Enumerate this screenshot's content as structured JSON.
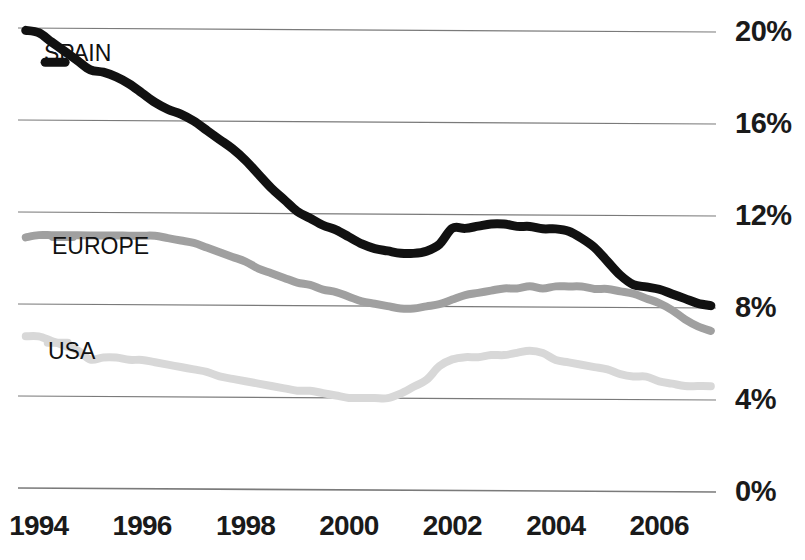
{
  "chart_data": {
    "type": "line",
    "title": "",
    "subtitle": "",
    "xlabel": "",
    "ylabel": "",
    "xlim": [
      1993.6,
      2007.1
    ],
    "ylim": [
      0,
      20
    ],
    "grid": true,
    "grid_axis": "y",
    "legend_position": "inline-left",
    "x_ticks": [
      1994,
      1996,
      1998,
      2000,
      2002,
      2004,
      2006
    ],
    "x_tick_labels": [
      "1994",
      "1996",
      "1998",
      "2000",
      "2002",
      "2004",
      "2006"
    ],
    "y_ticks": [
      0,
      4,
      8,
      12,
      16,
      20
    ],
    "y_tick_labels": [
      "0%",
      "4%",
      "8%",
      "12%",
      "16%",
      "20%"
    ],
    "series": [
      {
        "name": "SPAIN",
        "color": "#111111",
        "line_width": 9,
        "label_x": 1994.55,
        "label_y": 18.6,
        "x": [
          1993.75,
          1994.0,
          1994.25,
          1994.5,
          1994.75,
          1995.0,
          1995.25,
          1995.5,
          1995.75,
          1996.0,
          1996.25,
          1996.5,
          1996.75,
          1997.0,
          1997.25,
          1997.5,
          1997.75,
          1998.0,
          1998.25,
          1998.5,
          1998.75,
          1999.0,
          1999.25,
          1999.5,
          1999.75,
          2000.0,
          2000.25,
          2000.5,
          2000.75,
          2001.0,
          2001.25,
          2001.5,
          2001.75,
          2002.0,
          2002.25,
          2002.5,
          2002.75,
          2003.0,
          2003.25,
          2003.5,
          2003.75,
          2004.0,
          2004.25,
          2004.5,
          2004.75,
          2005.0,
          2005.25,
          2005.5,
          2005.75,
          2006.0,
          2006.25,
          2006.5,
          2006.75,
          2007.0
        ],
        "y": [
          19.9,
          19.8,
          19.4,
          19.0,
          18.6,
          18.2,
          18.1,
          17.9,
          17.6,
          17.2,
          16.8,
          16.5,
          16.3,
          16.0,
          15.6,
          15.2,
          14.8,
          14.3,
          13.7,
          13.1,
          12.6,
          12.1,
          11.8,
          11.5,
          11.3,
          11.0,
          10.7,
          10.5,
          10.4,
          10.3,
          10.3,
          10.4,
          10.7,
          11.4,
          11.4,
          11.5,
          11.6,
          11.6,
          11.5,
          11.5,
          11.4,
          11.4,
          11.3,
          11.0,
          10.6,
          10.0,
          9.4,
          9.0,
          8.9,
          8.8,
          8.6,
          8.4,
          8.2,
          8.1
        ]
      },
      {
        "name": "EUROPE",
        "color": "#a0a0a0",
        "line_width": 8,
        "label_x": 1994.7,
        "label_y": 11.0,
        "x": [
          1993.75,
          1994.0,
          1994.25,
          1994.5,
          1994.75,
          1995.0,
          1995.25,
          1995.5,
          1995.75,
          1996.0,
          1996.25,
          1996.5,
          1996.75,
          1997.0,
          1997.25,
          1997.5,
          1997.75,
          1998.0,
          1998.25,
          1998.5,
          1998.75,
          1999.0,
          1999.25,
          1999.5,
          1999.75,
          2000.0,
          2000.25,
          2000.5,
          2000.75,
          2001.0,
          2001.25,
          2001.5,
          2001.75,
          2002.0,
          2002.25,
          2002.5,
          2002.75,
          2003.0,
          2003.25,
          2003.5,
          2003.75,
          2004.0,
          2004.25,
          2004.5,
          2004.75,
          2005.0,
          2005.25,
          2005.5,
          2005.75,
          2006.0,
          2006.25,
          2006.5,
          2006.75,
          2007.0
        ],
        "y": [
          10.9,
          11.0,
          11.0,
          11.0,
          11.0,
          11.0,
          11.0,
          11.0,
          11.0,
          11.0,
          11.0,
          10.9,
          10.8,
          10.7,
          10.5,
          10.3,
          10.1,
          9.9,
          9.6,
          9.4,
          9.2,
          9.0,
          8.9,
          8.7,
          8.6,
          8.4,
          8.2,
          8.1,
          8.0,
          7.9,
          7.9,
          8.0,
          8.1,
          8.3,
          8.5,
          8.6,
          8.7,
          8.8,
          8.8,
          8.9,
          8.8,
          8.9,
          8.9,
          8.9,
          8.8,
          8.8,
          8.7,
          8.6,
          8.4,
          8.2,
          7.9,
          7.5,
          7.2,
          7.0
        ]
      },
      {
        "name": "USA",
        "color": "#d8d8d8",
        "line_width": 8,
        "label_x": 1994.6,
        "label_y": 6.4,
        "x": [
          1993.75,
          1994.0,
          1994.25,
          1994.5,
          1994.75,
          1995.0,
          1995.25,
          1995.5,
          1995.75,
          1996.0,
          1996.25,
          1996.5,
          1996.75,
          1997.0,
          1997.25,
          1997.5,
          1997.75,
          1998.0,
          1998.25,
          1998.5,
          1998.75,
          1999.0,
          1999.25,
          1999.5,
          1999.75,
          2000.0,
          2000.25,
          2000.5,
          2000.75,
          2001.0,
          2001.25,
          2001.5,
          2001.75,
          2002.0,
          2002.25,
          2002.5,
          2002.75,
          2003.0,
          2003.25,
          2003.5,
          2003.75,
          2004.0,
          2004.25,
          2004.5,
          2004.75,
          2005.0,
          2005.25,
          2005.5,
          2005.75,
          2006.0,
          2006.25,
          2006.5,
          2006.75,
          2007.0
        ],
        "y": [
          6.6,
          6.6,
          6.4,
          6.2,
          6.0,
          5.6,
          5.7,
          5.7,
          5.6,
          5.6,
          5.5,
          5.4,
          5.3,
          5.2,
          5.1,
          4.9,
          4.8,
          4.7,
          4.6,
          4.5,
          4.4,
          4.3,
          4.3,
          4.2,
          4.1,
          4.0,
          4.0,
          4.0,
          4.0,
          4.2,
          4.5,
          4.8,
          5.4,
          5.7,
          5.8,
          5.8,
          5.9,
          5.9,
          6.0,
          6.1,
          6.0,
          5.7,
          5.6,
          5.5,
          5.4,
          5.3,
          5.1,
          5.0,
          5.0,
          4.8,
          4.7,
          4.6,
          4.6,
          4.6
        ]
      }
    ]
  },
  "axis": {
    "y_labels": [
      "20%",
      "16%",
      "12%",
      "8%",
      "4%",
      "0%"
    ],
    "x_labels": [
      "1994",
      "1996",
      "1998",
      "2000",
      "2002",
      "2004",
      "2006"
    ]
  },
  "legend": {
    "spain": "SPAIN",
    "europe": "EUROPE",
    "usa": "USA"
  },
  "colors": {
    "spain": "#111111",
    "europe": "#a0a0a0",
    "usa": "#d8d8d8",
    "gridline": "#7a7a7a",
    "text": "#1a1a1a",
    "background": "#ffffff"
  }
}
